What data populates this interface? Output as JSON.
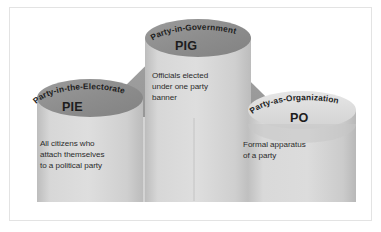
{
  "diagram": {
    "type": "pediment-with-cylinders",
    "colors": {
      "frame_border": "#e3e3e3",
      "page_background": "#ffffff",
      "pediment": "#9a9a9a",
      "pediment_shadow": "#8c8c8c",
      "base": "#d2d2d2",
      "cylinder_light": "#d8d8d8",
      "cylinder_mid": "#c9c9c9",
      "cylinder_dark_top": "#8f8f8f",
      "cylinder_light_top": "#dedede",
      "text": "#2b2b2b",
      "acronym_text": "#1d1d1d"
    },
    "columns": [
      {
        "id": "pie",
        "arc_label": "Party-in-the-Electorate",
        "acronym": "PIE",
        "body": "All citizens who\nattach themselves\nto a political party",
        "top_ellipse_tone": "dark"
      },
      {
        "id": "pig",
        "arc_label": "Party-in-Government",
        "acronym": "PIG",
        "body": "Officials elected\nunder one party\nbanner",
        "top_ellipse_tone": "dark"
      },
      {
        "id": "po",
        "arc_label": "Party-as-Organization",
        "acronym": "PO",
        "body": "Formal apparatus\nof a party",
        "top_ellipse_tone": "light"
      }
    ]
  }
}
